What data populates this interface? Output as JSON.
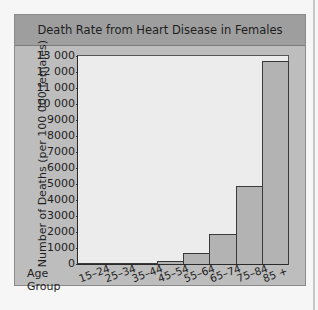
{
  "chart_data": {
    "type": "bar",
    "title": "Death Rate from Heart Disease in Females",
    "xlabel": "Age Group",
    "ylabel": "Number of Deaths (per 100 000 females)",
    "categories": [
      "15–24",
      "25–34",
      "35–44",
      "45–54",
      "55–64",
      "65–74",
      "75–84",
      "85 +"
    ],
    "values": [
      3,
      10,
      50,
      200,
      700,
      1850,
      4850,
      12700
    ],
    "ylim": [
      0,
      13000
    ],
    "yticks": [
      0,
      1000,
      2000,
      3000,
      4000,
      5000,
      6000,
      7000,
      8000,
      9000,
      10000,
      11000,
      12000,
      13000
    ],
    "ytick_labels": [
      "0",
      "1000",
      "2000",
      "3000",
      "4000",
      "5000",
      "6000",
      "7000",
      "8000",
      "9000",
      "10 000",
      "11 000",
      "12 000",
      "13 000"
    ],
    "grid": false,
    "legend": null
  },
  "labels": {
    "title": "Death Rate from Heart Disease in Females",
    "y_title": "Number of Deaths    (per 100 000 females)",
    "x_title_line1": "Age",
    "x_title_line2": "Group"
  }
}
